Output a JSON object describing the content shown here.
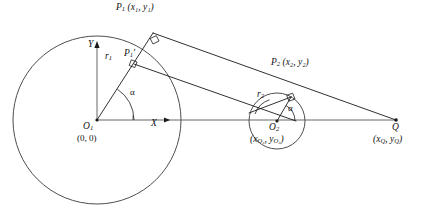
{
  "figure": {
    "background_color": "#ffffff",
    "line_color": "#1a1a1a",
    "circle_color": "#3a3a3a",
    "axis_color": "#555555",
    "width": 425,
    "height": 206
  },
  "labels": {
    "p1": "P",
    "p1_sub": "1",
    "p1_coords": "(x₁, y₁)",
    "p1_prime": "P",
    "p1_prime_sub": "1",
    "p1_prime_mark": "′",
    "p2": "P",
    "p2_sub": "2",
    "p2_coords": "(x₂, y₂)",
    "o1": "O",
    "o1_sub": "1",
    "o1_coords": "(0, 0)",
    "o2": "O",
    "o2_sub": "2",
    "o2_coords": "(x",
    "o2_coords_sub1": "O₂",
    "o2_coords_mid": ", y",
    "o2_coords_sub2": "O₂",
    "o2_coords_end": ")",
    "q": "Q",
    "q_coords": "(x",
    "q_coords_sub1": "Q",
    "q_coords_mid": ", y",
    "q_coords_sub2": "Q",
    "q_coords_end": ")",
    "r1": "r",
    "r1_sub": "1",
    "r2": "r",
    "r2_sub": "2",
    "alpha1": "α",
    "alpha2": "α",
    "x_axis": "X",
    "y_axis": "Y"
  },
  "geometry": {
    "circle1": {
      "cx": 97,
      "cy": 120,
      "r": 84,
      "center_label": "O1",
      "radius_label": "r1"
    },
    "circle2": {
      "cx": 277,
      "cy": 121,
      "r": 28,
      "center_label": "O2",
      "radius_label": "r2"
    },
    "tangent_point_1": {
      "x": 153,
      "y": 33
    },
    "tangent_point_2": {
      "x": 291,
      "y": 97
    },
    "apex_point_q": {
      "x": 396,
      "y": 120
    },
    "p1_prime": {
      "x": 134,
      "y": 64
    },
    "angle_alpha_degrees": 66,
    "axis_x_arrow_end": {
      "x": 170,
      "y": 120
    },
    "axis_y_arrow_end": {
      "x": 97,
      "y": 45
    }
  }
}
